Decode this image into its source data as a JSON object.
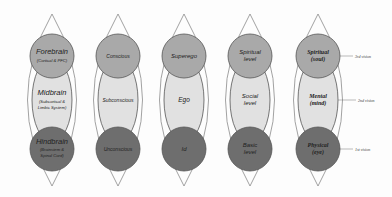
{
  "diagram": {
    "colors": {
      "background": "#fdfdfd",
      "lens_stroke": "#8a8a8a",
      "top_circle": "#a9a9a9",
      "middle_ellipse": "#e1e1e1",
      "bottom_circle": "#6e6e6e",
      "circle_stroke": "#555555"
    },
    "columns": [
      {
        "top": {
          "line1": "Forebrain",
          "line2": "(Cortical & PFC)"
        },
        "middle": {
          "line1": "Midbrain",
          "line2": "(Subcortical &",
          "line3": "Limbic System)"
        },
        "bottom": {
          "line1": "Hindbrain",
          "line2": "(Brainstem &",
          "line3": "Spinal Cord)"
        }
      },
      {
        "top": {
          "line1": "Conscious"
        },
        "middle": {
          "line1": "Subconscious"
        },
        "bottom": {
          "line1": "Unconscious"
        }
      },
      {
        "top": {
          "line1": "Superego"
        },
        "middle": {
          "line1": "Ego"
        },
        "bottom": {
          "line1": "Id"
        }
      },
      {
        "top": {
          "line1": "Spiritual",
          "line2": "level"
        },
        "middle": {
          "line1": "Social",
          "line2": "level"
        },
        "bottom": {
          "line1": "Basic",
          "line2": "level"
        }
      },
      {
        "top": {
          "line1": "Spiritual",
          "line2": "(soul)"
        },
        "middle": {
          "line1": "Mental",
          "line2": "(mind)"
        },
        "bottom": {
          "line1": "Physical",
          "line2": "(eye)"
        }
      }
    ],
    "annotations": {
      "top": "3rd vision",
      "middle": "2nd vision",
      "bottom": "1st vision"
    }
  }
}
